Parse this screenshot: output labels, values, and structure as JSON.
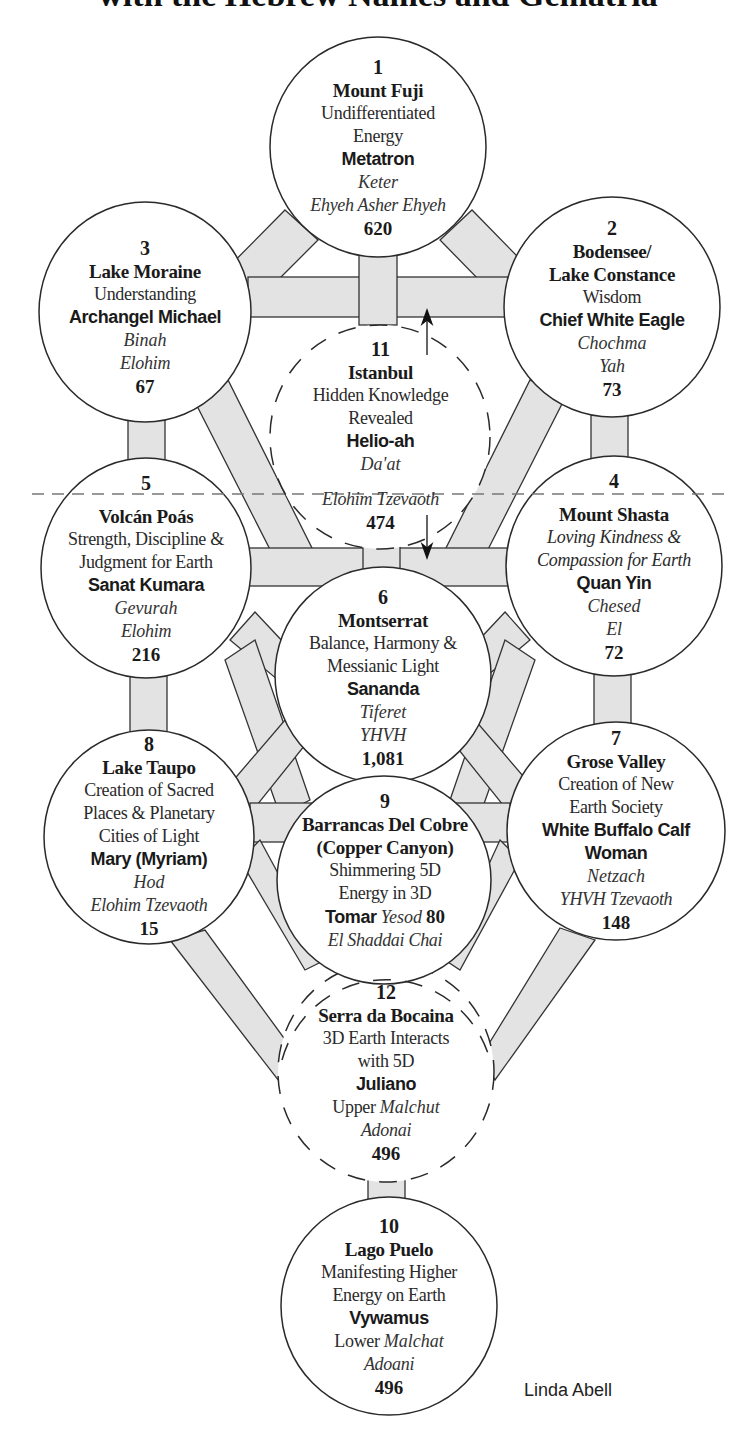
{
  "title": "with the Hebrew Names and Gematria",
  "credit": "Linda Abell",
  "colors": {
    "path_fill": "#e3e3e3",
    "outline": "#333333",
    "dashed_line": "#777777",
    "background": "#ffffff"
  },
  "divider": {
    "style": "dashed",
    "y": 494
  },
  "nodes": [
    {
      "number": "1",
      "place": "Mount Fuji",
      "quality": [
        "Undifferentiated",
        "Energy"
      ],
      "being": "Metatron",
      "sefira": "Keter",
      "god_name": "Ehyeh Asher Ehyeh",
      "gematria": "620",
      "dashed": false
    },
    {
      "number": "2",
      "place": [
        "Bodensee/",
        "Lake Constance"
      ],
      "quality": [
        "Wisdom"
      ],
      "being": "Chief White Eagle",
      "sefira": "Chochma",
      "god_name": "Yah",
      "gematria": "73",
      "dashed": false
    },
    {
      "number": "3",
      "place": "Lake Moraine",
      "quality": [
        "Understanding"
      ],
      "being": "Archangel Michael",
      "sefira": "Binah",
      "god_name": "Elohim",
      "gematria": "67",
      "dashed": false
    },
    {
      "number": "4",
      "place": "Mount Shasta",
      "quality": [
        "Loving Kindness &",
        "Compassion for Earth"
      ],
      "quality_italic": true,
      "being": "Quan Yin",
      "sefira": "Chesed",
      "god_name": "El",
      "gematria": "72",
      "dashed": false
    },
    {
      "number": "5",
      "place": "Volcán Poás",
      "quality": [
        "Strength, Discipline &",
        "Judgment for Earth"
      ],
      "being": "Sanat Kumara",
      "sefira": "Gevurah",
      "god_name": "Elohim",
      "gematria": "216",
      "dashed": false
    },
    {
      "number": "6",
      "place": "Montserrat",
      "quality": [
        "Balance, Harmony &",
        "Messianic Light"
      ],
      "being": "Sananda",
      "sefira": "Tiferet",
      "god_name": "YHVH",
      "gematria": "1,081",
      "dashed": false
    },
    {
      "number": "7",
      "place": "Grose Valley",
      "quality": [
        "Creation of New",
        "Earth Society"
      ],
      "being": [
        "White Buffalo Calf",
        "Woman"
      ],
      "sefira": "Netzach",
      "god_name": "YHVH Tzevaoth",
      "gematria": "148",
      "dashed": false
    },
    {
      "number": "8",
      "place": "Lake Taupo",
      "quality": [
        "Creation of Sacred",
        "Places & Planetary",
        "Cities of Light"
      ],
      "being": "Mary (Myriam)",
      "sefira": "Hod",
      "god_name": "Elohim Tzevaoth",
      "gematria": "15",
      "dashed": false
    },
    {
      "number": "9",
      "place": [
        "Barrancas Del Cobre",
        "(Copper Canyon)"
      ],
      "quality": [
        "Shimmering 5D",
        "Energy in 3D"
      ],
      "being": "Tomar",
      "sefira": "Yesod",
      "gematria": "80",
      "god_name": "El Shaddai Chai",
      "dashed": false
    },
    {
      "number": "10",
      "place": "Lago Puelo",
      "quality": [
        "Manifesting Higher",
        "Energy on Earth"
      ],
      "being": "Vywamus",
      "sefira_prefix": "Lower",
      "sefira": "Malchat",
      "god_name": "Adoani",
      "gematria": "496",
      "dashed": false
    },
    {
      "number": "11",
      "place": "Istanbul",
      "quality": [
        "Hidden Knowledge",
        "Revealed"
      ],
      "being": "Helio-ah",
      "sefira": "Da'at",
      "god_name": "Elohim Tzevaoth",
      "gematria": "474",
      "dashed": true
    },
    {
      "number": "12",
      "place": "Serra da Bocaina",
      "quality": [
        "3D Earth Interacts",
        "with 5D"
      ],
      "being": "Juliano",
      "sefira_prefix": "Upper",
      "sefira": "Malchut",
      "god_name": "Adonai",
      "gematria": "496",
      "dashed": true
    }
  ]
}
